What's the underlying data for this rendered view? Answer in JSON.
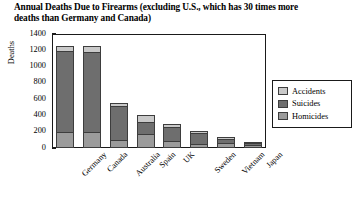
{
  "chart_data": {
    "type": "bar",
    "subtype": "stacked-vertical",
    "title": "Annual Deaths Due to Firearms (excluding U.S., which has 30 times more deaths than Germany and Canada)",
    "title_lines": [
      "Annual Deaths Due to Firearms (excluding U.S., which",
      "has 30 times more deaths than Germany and Canada)"
    ],
    "xlabel": "",
    "ylabel": "Deaths",
    "ylim": [
      0,
      1400
    ],
    "ytick_step": 200,
    "yticks": [
      1400,
      1200,
      1000,
      800,
      600,
      400,
      200,
      0
    ],
    "ytick_labels": [
      "1400",
      "1200",
      "1000",
      "800",
      "600",
      "400",
      "200",
      "0"
    ],
    "grid": false,
    "legend_position": "right-outside",
    "categories": [
      "Germany",
      "Canada",
      "Australia",
      "Spain",
      "UK",
      "Sweden",
      "Vietnam",
      "Japan"
    ],
    "series": [
      {
        "name": "Homicides",
        "color": "#9b9b9b",
        "values": [
          185,
          185,
          85,
          165,
          70,
          35,
          60,
          25
        ]
      },
      {
        "name": "Suicides",
        "color": "#6e6e6e",
        "values": [
          1015,
          1000,
          440,
          150,
          195,
          160,
          55,
          45
        ]
      },
      {
        "name": "Accidents",
        "color": "#c9c9c9",
        "values": [
          50,
          65,
          25,
          90,
          25,
          15,
          15,
          10
        ]
      }
    ],
    "totals": [
      1250,
      1250,
      550,
      405,
      290,
      210,
      130,
      80
    ],
    "legend": [
      {
        "label": "Accidents",
        "color": "#c9c9c9"
      },
      {
        "label": "Suicides",
        "color": "#6e6e6e"
      },
      {
        "label": "Homicides",
        "color": "#9b9b9b"
      }
    ]
  }
}
